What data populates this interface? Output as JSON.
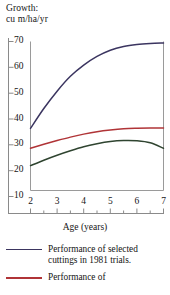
{
  "figure": {
    "name": "growth-vs-age-line-chart"
  },
  "chart_data": {
    "type": "line",
    "title": "",
    "ylabel": "Growth:\ncu m/ha/yr",
    "ylabel_line1": "Growth:",
    "ylabel_line2": "cu m/ha/yr",
    "xlabel": "Age (years)",
    "xlim": [
      2,
      7
    ],
    "ylim": [
      10,
      70
    ],
    "grid": false,
    "legend_position": "below",
    "yticks": [
      70,
      60,
      50,
      40,
      30,
      20,
      10
    ],
    "ytick_labels": [
      "70",
      "60",
      "50",
      "40",
      "30",
      "20",
      "10"
    ],
    "xticks": [
      2,
      3,
      4,
      5,
      6,
      7
    ],
    "xtick_labels": [
      "2",
      "3",
      "4",
      "5",
      "6",
      "7"
    ],
    "xminor_ticks": [
      2.5,
      3.5,
      4.5,
      5.5,
      6.5
    ],
    "x": [
      2,
      2.5,
      3,
      3.5,
      4,
      4.5,
      5,
      5.5,
      6,
      6.5,
      7
    ],
    "series": [
      {
        "name": "selected-cuttings-1981",
        "label": "Performance of selected cuttings in 1981 trials.",
        "color": "#3b3560",
        "values": [
          35,
          43,
          50,
          56,
          60.5,
          64,
          66.5,
          68,
          68.8,
          69.2,
          69.4
        ]
      },
      {
        "name": "series-red",
        "label": "Performance of",
        "color": "#b03437",
        "values": [
          27,
          28.6,
          30.1,
          31.5,
          32.7,
          33.7,
          34.4,
          34.9,
          35.1,
          35.2,
          35.2
        ]
      },
      {
        "name": "series-green",
        "label": "",
        "color": "#2f4430",
        "values": [
          20,
          22.2,
          24.2,
          26.0,
          27.6,
          28.8,
          29.7,
          30.1,
          30.0,
          29.2,
          27.0
        ]
      }
    ]
  },
  "legend": {
    "entries": [
      {
        "color": "#3b3560",
        "text": "Performance of selected cuttings in 1981 trials."
      },
      {
        "color": "#b03437",
        "text": "Performance of"
      }
    ]
  },
  "colors": {
    "navy": "#3b3560",
    "red": "#b03437",
    "green": "#2f4430",
    "axis": "#8a8a8a",
    "text": "#141414"
  }
}
